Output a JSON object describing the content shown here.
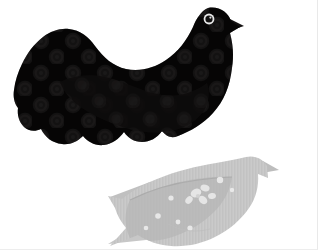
{
  "canvas": {
    "width": 318,
    "height": 250,
    "background_color": "#ffffff",
    "border_color": "#ebebeb",
    "description": "Two fabric bird cutouts arranged on a plain white background"
  },
  "objects": [
    {
      "id": "dark-bird",
      "label": "Large black patterned fabric bird",
      "material": "velvet / flocked cotton",
      "fill_color": "#0b0a0a",
      "body_shade_color": "#151414",
      "wing_color": "#1a1818",
      "pattern": "polka-dot circles",
      "pattern_color": "#2a2828",
      "eye_ring_color": "#e7e7e7",
      "eye_pupil_color": "#0a0a0a",
      "facing": "right",
      "bounding_box": {
        "x": 14,
        "y": 6,
        "width": 226,
        "height": 142
      }
    },
    {
      "id": "gray-bird",
      "label": "Small light gray patterned fabric bird",
      "material": "printed cotton",
      "fill_color": "#c9c9c9",
      "body_shade_color": "#bcbcbc",
      "wing_color": "#b4b4b4",
      "pattern": "floral motif and scattered dots",
      "pattern_color": "#e9e9e9",
      "facing": "right",
      "bounding_box": {
        "x": 108,
        "y": 152,
        "width": 160,
        "height": 94
      }
    }
  ],
  "colors": {
    "white": "#ffffff",
    "near_black": "#0b0a0a",
    "dot_dark": "#2a2828",
    "highlight": "#e7e7e7",
    "mid_gray": "#c9c9c9",
    "shadow_gray": "#b0b0b0",
    "light_gray": "#e4e4e4"
  }
}
